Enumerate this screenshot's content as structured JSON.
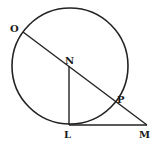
{
  "diagram": {
    "type": "geometry",
    "stroke_color": "#222222",
    "background": "#ffffff",
    "circle": {
      "cx": 70,
      "cy": 66,
      "r": 58
    },
    "points": {
      "O": {
        "x": 23,
        "y": 32,
        "label": "O"
      },
      "N": {
        "x": 69,
        "y": 66,
        "label": "N"
      },
      "P": {
        "x": 115,
        "y": 101,
        "label": "P"
      },
      "L": {
        "x": 69,
        "y": 125,
        "label": "L"
      },
      "M": {
        "x": 147,
        "y": 125,
        "label": "M"
      }
    },
    "segments": [
      {
        "from": "O",
        "to": "M"
      },
      {
        "from": "N",
        "to": "L"
      },
      {
        "from": "L",
        "to": "M"
      }
    ]
  }
}
